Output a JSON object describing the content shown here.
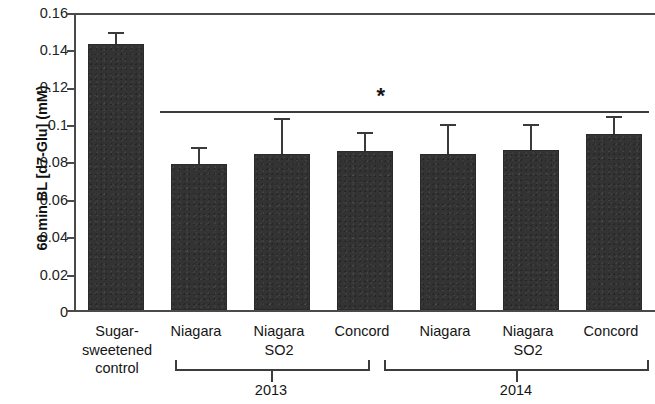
{
  "chart_data": {
    "type": "bar",
    "title": "",
    "xlabel": "",
    "ylabel": "60 min BL [d7-Glu] (mM)",
    "ylim": [
      0,
      0.16
    ],
    "ytick_labels": [
      "0.16",
      "0.14",
      "0.12",
      "0.1",
      "0.08",
      "0.06",
      "0.04",
      "0.02",
      "0"
    ],
    "ytick_values": [
      0.16,
      0.14,
      0.12,
      0.1,
      0.08,
      0.06,
      0.04,
      0.02,
      0
    ],
    "grid": false,
    "legend": false,
    "bar_color": "#333333",
    "categories": [
      "Sugar-\nsweetened\ncontrol",
      "Niagara",
      "Niagara\nSO2",
      "Concord",
      "Niagara",
      "Niagara\nSO2",
      "Concord"
    ],
    "values": [
      0.1433,
      0.0786,
      0.0843,
      0.0855,
      0.0838,
      0.0864,
      0.0947
    ],
    "errors": [
      0.0053,
      0.0079,
      0.018,
      0.0095,
      0.0155,
      0.013,
      0.009
    ],
    "groups": [
      {
        "label": "2013",
        "category_indices": [
          1,
          2,
          3
        ]
      },
      {
        "label": "2014",
        "category_indices": [
          4,
          5,
          6
        ]
      }
    ],
    "annotations": [
      {
        "text": "*",
        "type": "significance-bracket",
        "spans_categories": [
          1,
          6
        ],
        "y": 0.107,
        "note": "horizontal line spanning all juice treatments with asterisk above"
      }
    ]
  }
}
